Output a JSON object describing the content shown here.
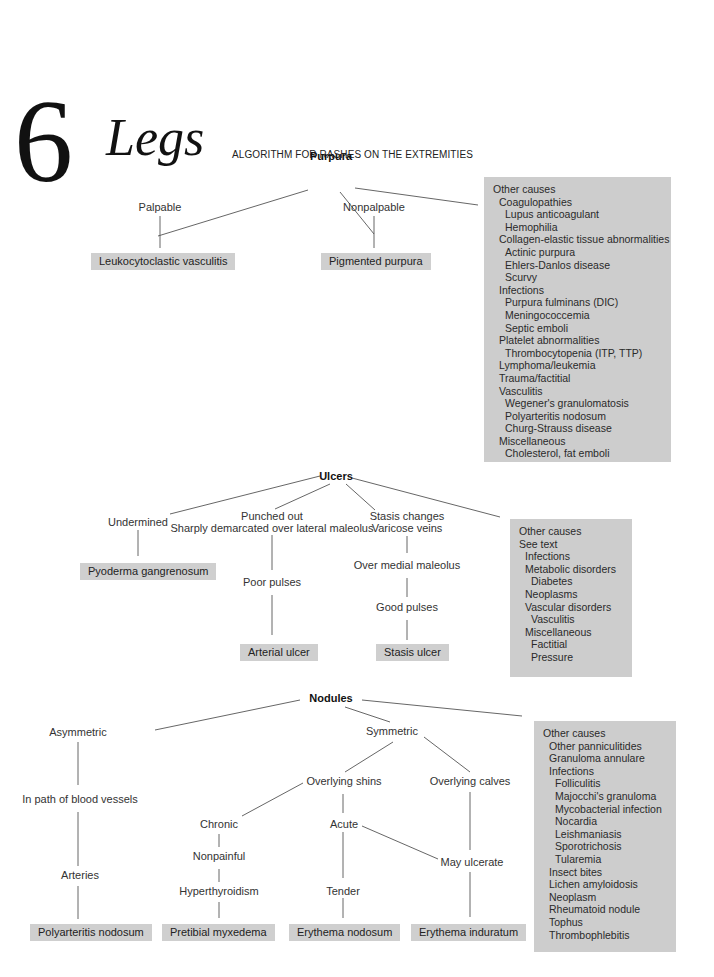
{
  "header": {
    "chapter_number": "6",
    "chapter_title": "Legs",
    "subtitle": "ALGORITHM  FOR RASHES ON THE EXTREMITIES"
  },
  "purpura": {
    "root": "Purpura",
    "branches": [
      "Palpable",
      "Nonpalpable"
    ],
    "diagnoses": [
      "Leukocytoclastic vasculitis",
      "Pigmented purpura"
    ],
    "other_causes": [
      {
        "text": "Other causes",
        "level": 0
      },
      {
        "text": "Coagulopathies",
        "level": 1
      },
      {
        "text": "Lupus anticoagulant",
        "level": 2
      },
      {
        "text": "Hemophilia",
        "level": 2
      },
      {
        "text": "Collagen-elastic tissue abnormalities",
        "level": 1
      },
      {
        "text": "Actinic purpura",
        "level": 2
      },
      {
        "text": "Ehlers-Danlos disease",
        "level": 2
      },
      {
        "text": "Scurvy",
        "level": 2
      },
      {
        "text": "Infections",
        "level": 1
      },
      {
        "text": "Purpura fulminans (DIC)",
        "level": 2
      },
      {
        "text": "Meningococcemia",
        "level": 2
      },
      {
        "text": "Septic emboli",
        "level": 2
      },
      {
        "text": "Platelet abnormalities",
        "level": 1
      },
      {
        "text": "Thrombocytopenia (ITP, TTP)",
        "level": 2
      },
      {
        "text": "Lymphoma/leukemia",
        "level": 1
      },
      {
        "text": "Trauma/factitial",
        "level": 1
      },
      {
        "text": "Vasculitis",
        "level": 1
      },
      {
        "text": "Wegener's granulomatosis",
        "level": 2
      },
      {
        "text": "Polyarteritis nodosum",
        "level": 2
      },
      {
        "text": "Churg-Strauss disease",
        "level": 2
      },
      {
        "text": "Miscellaneous",
        "level": 1
      },
      {
        "text": "Cholesterol, fat emboli",
        "level": 2
      }
    ]
  },
  "ulcers": {
    "root": "Ulcers",
    "branches": [
      "Undermined",
      "Punched out",
      "Sharply demarcated over lateral maleolus",
      "Stasis changes",
      "Varicose veins"
    ],
    "steps": [
      "Poor pulses",
      "Over medial maleolus",
      "Good pulses"
    ],
    "diagnoses": [
      "Pyoderma gangrenosum",
      "Arterial ulcer",
      "Stasis ulcer"
    ],
    "other_causes": [
      {
        "text": "Other causes",
        "level": 0
      },
      {
        "text": "See text",
        "level": 0
      },
      {
        "text": "Infections",
        "level": 1
      },
      {
        "text": "Metabolic disorders",
        "level": 1
      },
      {
        "text": "Diabetes",
        "level": 2
      },
      {
        "text": "Neoplasms",
        "level": 1
      },
      {
        "text": "Vascular disorders",
        "level": 1
      },
      {
        "text": "Vasculitis",
        "level": 2
      },
      {
        "text": "Miscellaneous",
        "level": 1
      },
      {
        "text": "Factitial",
        "level": 2
      },
      {
        "text": "Pressure",
        "level": 2
      }
    ]
  },
  "nodules": {
    "root": "Nodules",
    "nodes": [
      "Asymmetric",
      "Symmetric",
      "In path of blood vessels",
      "Arteries",
      "Overlying shins",
      "Overlying calves",
      "Chronic",
      "Nonpainful",
      "Hyperthyroidism",
      "Acute",
      "Tender",
      "May ulcerate"
    ],
    "diagnoses": [
      "Polyarteritis nodosum",
      "Pretibial myxedema",
      "Erythema nodosum",
      "Erythema induratum"
    ],
    "other_causes": [
      {
        "text": "Other causes",
        "level": 0
      },
      {
        "text": "Other panniculitides",
        "level": 1
      },
      {
        "text": "Granuloma annulare",
        "level": 1
      },
      {
        "text": "Infections",
        "level": 1
      },
      {
        "text": "Folliculitis",
        "level": 2
      },
      {
        "text": "Majocchi's granuloma",
        "level": 2
      },
      {
        "text": "Mycobacterial infection",
        "level": 2
      },
      {
        "text": "Nocardia",
        "level": 2
      },
      {
        "text": "Leishmaniasis",
        "level": 2
      },
      {
        "text": "Sporotrichosis",
        "level": 2
      },
      {
        "text": "Tularemia",
        "level": 2
      },
      {
        "text": "Insect bites",
        "level": 1
      },
      {
        "text": "Lichen amyloidosis",
        "level": 1
      },
      {
        "text": "Neoplasm",
        "level": 1
      },
      {
        "text": "Rheumatoid nodule",
        "level": 1
      },
      {
        "text": "Tophus",
        "level": 1
      },
      {
        "text": "Thrombophlebitis",
        "level": 1
      }
    ]
  },
  "colors": {
    "box_fill": "#cdcdcd",
    "line": "#555555",
    "text": "#2a2a2a"
  }
}
